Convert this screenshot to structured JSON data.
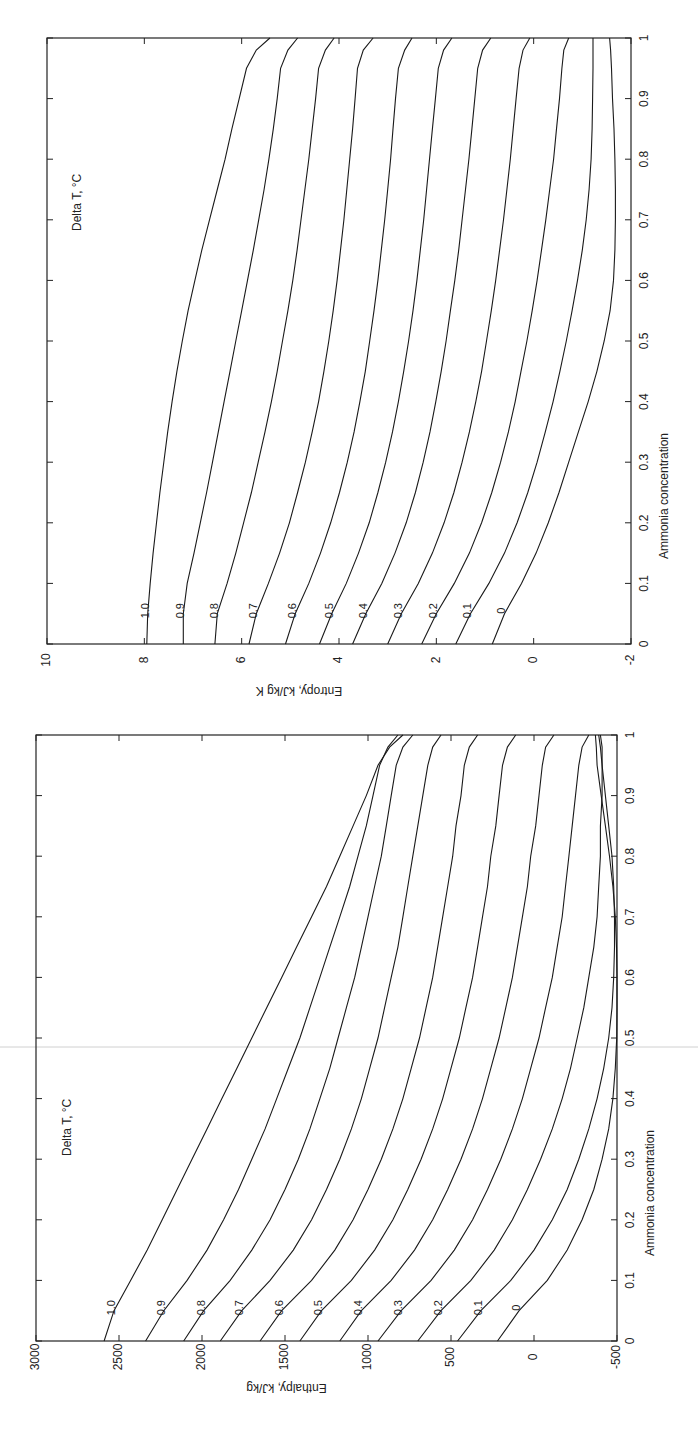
{
  "chart_data": [
    {
      "type": "line",
      "title": "",
      "orientation_note": "rendered rotated 90 degrees counter-clockwise on page",
      "xlabel": "Ammonia concentration",
      "ylabel": "Entropy, kJ/kg K",
      "xlim": [
        0,
        1
      ],
      "ylim": [
        -2,
        10
      ],
      "xticks": [
        "0",
        "0.1",
        "0.2",
        "0.3",
        "0.4",
        "0.5",
        "0.6",
        "0.7",
        "0.8",
        "0.9",
        "1"
      ],
      "yticks": [
        "-2",
        "0",
        "2",
        "4",
        "6",
        "8",
        "10"
      ],
      "legend_title": "Delta T, °C",
      "grid": false,
      "x": [
        0,
        0.05,
        0.1,
        0.15,
        0.2,
        0.25,
        0.3,
        0.35,
        0.4,
        0.45,
        0.5,
        0.55,
        0.6,
        0.65,
        0.7,
        0.75,
        0.8,
        0.85,
        0.9,
        0.95,
        0.98,
        1.0
      ],
      "series": [
        {
          "name": "1.0",
          "values": [
            7.95,
            7.93,
            7.88,
            7.82,
            7.75,
            7.68,
            7.6,
            7.52,
            7.43,
            7.33,
            7.22,
            7.1,
            6.96,
            6.82,
            6.66,
            6.5,
            6.34,
            6.2,
            6.05,
            5.9,
            5.7,
            5.42
          ]
        },
        {
          "name": "0.9",
          "values": [
            7.2,
            7.2,
            7.12,
            6.98,
            6.85,
            6.72,
            6.6,
            6.48,
            6.36,
            6.24,
            6.12,
            6.0,
            5.88,
            5.76,
            5.65,
            5.54,
            5.44,
            5.35,
            5.27,
            5.2,
            5.05,
            4.85
          ]
        },
        {
          "name": "0.8",
          "values": [
            6.55,
            6.5,
            6.3,
            6.12,
            5.96,
            5.8,
            5.66,
            5.52,
            5.39,
            5.27,
            5.16,
            5.05,
            4.95,
            4.86,
            4.78,
            4.7,
            4.62,
            4.55,
            4.48,
            4.42,
            4.28,
            4.1
          ]
        },
        {
          "name": "0.7",
          "values": [
            5.85,
            5.7,
            5.45,
            5.22,
            5.02,
            4.85,
            4.69,
            4.55,
            4.42,
            4.31,
            4.21,
            4.12,
            4.04,
            3.97,
            3.9,
            3.84,
            3.78,
            3.72,
            3.67,
            3.62,
            3.5,
            3.3
          ]
        },
        {
          "name": "0.6",
          "values": [
            5.1,
            4.9,
            4.62,
            4.38,
            4.17,
            3.99,
            3.83,
            3.69,
            3.57,
            3.46,
            3.37,
            3.28,
            3.2,
            3.13,
            3.06,
            3.0,
            2.94,
            2.89,
            2.84,
            2.78,
            2.65,
            2.5
          ]
        },
        {
          "name": "0.5",
          "values": [
            4.4,
            4.15,
            3.85,
            3.6,
            3.38,
            3.2,
            3.04,
            2.9,
            2.78,
            2.67,
            2.57,
            2.48,
            2.4,
            2.33,
            2.26,
            2.2,
            2.14,
            2.08,
            2.02,
            1.96,
            1.85,
            1.68
          ]
        },
        {
          "name": "0.4",
          "values": [
            3.72,
            3.45,
            3.12,
            2.85,
            2.62,
            2.43,
            2.27,
            2.13,
            2.01,
            1.9,
            1.8,
            1.71,
            1.62,
            1.54,
            1.47,
            1.4,
            1.33,
            1.27,
            1.21,
            1.15,
            1.05,
            0.88
          ]
        },
        {
          "name": "0.3",
          "values": [
            3.0,
            2.72,
            2.37,
            2.08,
            1.84,
            1.64,
            1.47,
            1.32,
            1.19,
            1.07,
            0.97,
            0.87,
            0.78,
            0.7,
            0.62,
            0.55,
            0.48,
            0.42,
            0.36,
            0.3,
            0.22,
            0.08
          ]
        },
        {
          "name": "0.2",
          "values": [
            2.3,
            2.0,
            1.63,
            1.32,
            1.07,
            0.86,
            0.68,
            0.52,
            0.38,
            0.26,
            0.14,
            0.03,
            -0.07,
            -0.16,
            -0.25,
            -0.33,
            -0.41,
            -0.47,
            -0.53,
            -0.58,
            -0.62,
            -0.72
          ]
        },
        {
          "name": "0.1",
          "values": [
            1.6,
            1.3,
            0.92,
            0.6,
            0.34,
            0.12,
            -0.07,
            -0.24,
            -0.4,
            -0.54,
            -0.67,
            -0.79,
            -0.9,
            -1.0,
            -1.08,
            -1.14,
            -1.18,
            -1.2,
            -1.21,
            -1.22,
            -1.22,
            -1.22
          ]
        },
        {
          "name": "0",
          "values": [
            0.85,
            0.6,
            0.25,
            -0.05,
            -0.3,
            -0.52,
            -0.72,
            -0.92,
            -1.12,
            -1.3,
            -1.45,
            -1.57,
            -1.64,
            -1.67,
            -1.68,
            -1.68,
            -1.67,
            -1.65,
            -1.62,
            -1.6,
            -1.58,
            -1.56
          ]
        }
      ]
    },
    {
      "type": "line",
      "title": "",
      "orientation_note": "rendered rotated 90 degrees counter-clockwise on page",
      "xlabel": "Ammonia concentration",
      "ylabel": "Enthalpy, kJ/kg",
      "xlim": [
        0,
        1
      ],
      "ylim": [
        -500,
        3000
      ],
      "xticks": [
        "0",
        "0.1",
        "0.2",
        "0.3",
        "0.4",
        "0.5",
        "0.6",
        "0.7",
        "0.8",
        "0.9",
        "1"
      ],
      "yticks": [
        "-500",
        "0",
        "500",
        "1000",
        "1500",
        "2000",
        "2500",
        "3000"
      ],
      "legend_title": "Delta T, °C",
      "grid": false,
      "x": [
        0,
        0.05,
        0.1,
        0.15,
        0.2,
        0.25,
        0.3,
        0.35,
        0.4,
        0.45,
        0.5,
        0.55,
        0.6,
        0.65,
        0.7,
        0.75,
        0.8,
        0.85,
        0.9,
        0.95,
        0.98,
        1.0
      ],
      "series": [
        {
          "name": "1.0",
          "values": [
            2590,
            2530,
            2430,
            2330,
            2240,
            2150,
            2060,
            1970,
            1880,
            1790,
            1700,
            1610,
            1520,
            1430,
            1340,
            1250,
            1170,
            1090,
            1010,
            940,
            870,
            790
          ]
        },
        {
          "name": "0.9",
          "values": [
            2340,
            2230,
            2090,
            1970,
            1870,
            1780,
            1700,
            1620,
            1550,
            1480,
            1410,
            1350,
            1290,
            1230,
            1170,
            1110,
            1060,
            1010,
            970,
            930,
            880,
            820
          ]
        },
        {
          "name": "0.8",
          "values": [
            2110,
            1990,
            1830,
            1700,
            1590,
            1500,
            1420,
            1350,
            1290,
            1230,
            1180,
            1130,
            1080,
            1040,
            1000,
            960,
            920,
            890,
            860,
            830,
            790,
            730
          ]
        },
        {
          "name": "0.7",
          "values": [
            1890,
            1760,
            1590,
            1450,
            1340,
            1250,
            1170,
            1100,
            1040,
            990,
            940,
            900,
            860,
            820,
            790,
            760,
            730,
            700,
            670,
            640,
            610,
            560
          ]
        },
        {
          "name": "0.6",
          "values": [
            1650,
            1520,
            1340,
            1200,
            1090,
            1000,
            920,
            850,
            790,
            740,
            690,
            650,
            610,
            580,
            550,
            520,
            490,
            470,
            440,
            420,
            390,
            340
          ]
        },
        {
          "name": "0.5",
          "values": [
            1410,
            1280,
            1100,
            960,
            850,
            760,
            680,
            610,
            550,
            500,
            450,
            410,
            370,
            340,
            310,
            280,
            260,
            230,
            210,
            190,
            160,
            110
          ]
        },
        {
          "name": "0.4",
          "values": [
            1170,
            1040,
            860,
            720,
            610,
            520,
            440,
            370,
            310,
            260,
            210,
            170,
            130,
            100,
            70,
            40,
            20,
            -10,
            -30,
            -50,
            -70,
            -120
          ]
        },
        {
          "name": "0.3",
          "values": [
            940,
            800,
            620,
            480,
            370,
            280,
            200,
            130,
            70,
            20,
            -30,
            -70,
            -110,
            -140,
            -170,
            -190,
            -210,
            -230,
            -250,
            -270,
            -290,
            -330
          ]
        },
        {
          "name": "0.2",
          "values": [
            700,
            560,
            380,
            240,
            130,
            40,
            -40,
            -110,
            -170,
            -220,
            -260,
            -300,
            -330,
            -360,
            -380,
            -390,
            -400,
            -400,
            -410,
            -410,
            -410,
            -400
          ]
        },
        {
          "name": "0.1",
          "values": [
            460,
            320,
            140,
            0,
            -110,
            -200,
            -270,
            -330,
            -380,
            -420,
            -450,
            -470,
            -480,
            -485,
            -485,
            -480,
            -470,
            -450,
            -430,
            -410,
            -400,
            -390
          ]
        },
        {
          "name": "0",
          "values": [
            220,
            90,
            -80,
            -200,
            -290,
            -360,
            -410,
            -450,
            -475,
            -490,
            -498,
            -500,
            -500,
            -497,
            -490,
            -475,
            -455,
            -430,
            -405,
            -380,
            -375,
            -370
          ]
        }
      ]
    }
  ],
  "plots": {
    "entropy": {
      "ylabel": "Entropy, kJ/kg K",
      "xlabel": "Ammonia concentration",
      "legend_title": "Delta T, °C"
    },
    "enthalpy": {
      "ylabel": "Enthalpy, kJ/kg",
      "xlabel": "Ammonia concentration",
      "legend_title": "Delta T, °C"
    }
  }
}
